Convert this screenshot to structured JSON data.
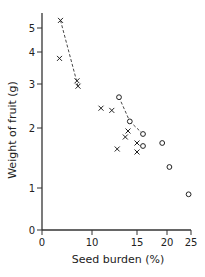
{
  "chart_data": {
    "type": "scatter",
    "title": "",
    "xlabel": "Seed burden (%)",
    "ylabel": "Weight of fruit (g)",
    "x_ticks": [
      0,
      10,
      15,
      20,
      25
    ],
    "y_ticks": [
      0,
      1,
      2,
      3,
      4,
      5
    ],
    "xlim": [
      0,
      25
    ],
    "ylim": [
      0,
      5.8
    ],
    "grid": false,
    "legend": null,
    "series": [
      {
        "name": "cross",
        "marker": "x",
        "points": [
          {
            "x": 3.7,
            "y": 5.4
          },
          {
            "x": 3.5,
            "y": 3.8
          },
          {
            "x": 7.0,
            "y": 3.1
          },
          {
            "x": 7.2,
            "y": 2.95
          },
          {
            "x": 11.0,
            "y": 2.45
          },
          {
            "x": 12.2,
            "y": 2.4
          },
          {
            "x": 14.0,
            "y": 1.95
          },
          {
            "x": 13.7,
            "y": 1.85
          },
          {
            "x": 12.8,
            "y": 1.65
          },
          {
            "x": 15.0,
            "y": 1.75
          },
          {
            "x": 15.0,
            "y": 1.6
          }
        ]
      },
      {
        "name": "circle",
        "marker": "o",
        "points": [
          {
            "x": 13.0,
            "y": 2.7
          },
          {
            "x": 14.2,
            "y": 2.15
          },
          {
            "x": 16.0,
            "y": 1.9
          },
          {
            "x": 16.0,
            "y": 1.7
          },
          {
            "x": 19.2,
            "y": 1.75
          },
          {
            "x": 20.5,
            "y": 1.35
          },
          {
            "x": 24.5,
            "y": 0.85
          }
        ]
      }
    ],
    "dashed_lines": [
      {
        "from": {
          "x": 3.7,
          "y": 5.4
        },
        "to": {
          "x": 7.2,
          "y": 2.95
        }
      },
      {
        "from": {
          "x": 13.0,
          "y": 2.7
        },
        "to": {
          "x": 14.2,
          "y": 2.15
        }
      },
      {
        "from": {
          "x": 14.2,
          "y": 2.15
        },
        "to": {
          "x": 16.0,
          "y": 1.9
        }
      }
    ]
  }
}
